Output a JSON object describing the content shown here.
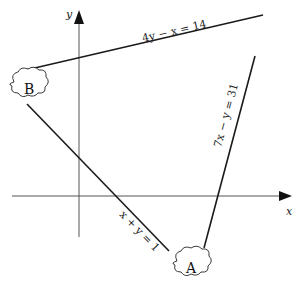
{
  "figure": {
    "axes": {
      "x_label": "x",
      "y_label": "y",
      "color": "#555555"
    },
    "lines": [
      {
        "id": "line-4y-minus-x",
        "equation": "4y − x = 14",
        "color": "#1a1a1a"
      },
      {
        "id": "line-x-plus-y",
        "equation": "x + y = 1",
        "color": "#1a1a1a"
      },
      {
        "id": "line-7x-minus-y",
        "equation": "7x − y = 31",
        "color": "#1a1a1a"
      }
    ],
    "points": [
      {
        "label": "A"
      },
      {
        "label": "B"
      }
    ]
  }
}
